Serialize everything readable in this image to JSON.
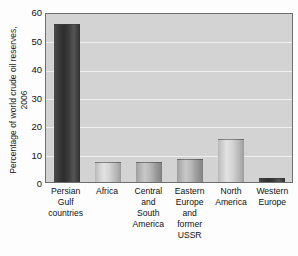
{
  "chart_data": {
    "type": "bar",
    "title": "",
    "xlabel": "",
    "ylabel": "Percentage of world crude oil reserves,\n2006",
    "ylim": [
      0,
      60
    ],
    "ytick_values": [
      0,
      10,
      20,
      30,
      40,
      50,
      60
    ],
    "ytick_labels": [
      "0",
      "10",
      "20",
      "30",
      "40",
      "50",
      "60"
    ],
    "grid": true,
    "grid_axis": "y",
    "grid_color": "#efefef",
    "legend": false,
    "plot_background": "#d3d3d3",
    "categories": [
      "Persian\nGulf\ncountries",
      "Africa",
      "Central\nand\nSouth\nAmerica",
      "Eastern\nEurope\nand\nformer\nUSSR",
      "North\nAmerica",
      "Western\nEurope"
    ],
    "values": [
      56.6,
      7.3,
      7.2,
      8.3,
      15.2,
      1.4
    ],
    "bar_styles": [
      "dark",
      "light",
      "mid",
      "mid",
      "light",
      "dark"
    ]
  },
  "colors": {
    "axis_line": "#6e6e6e",
    "text": "#111111",
    "bar_dark": "#333333",
    "bar_light": "#cfcfcf",
    "bar_mid": "#b0b0b0"
  }
}
